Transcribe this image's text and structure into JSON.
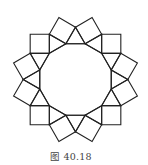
{
  "figure": {
    "polygon_sides": 12,
    "center": [
      75.5,
      79.5
    ],
    "circumradius": 37,
    "start_angle_deg": 15,
    "stroke_color": "#222222",
    "stroke_width": 1.1,
    "shapes": {
      "dodecagon": 1,
      "triangles": 12,
      "squares": 12
    }
  },
  "caption": {
    "text": "图 40.18"
  }
}
